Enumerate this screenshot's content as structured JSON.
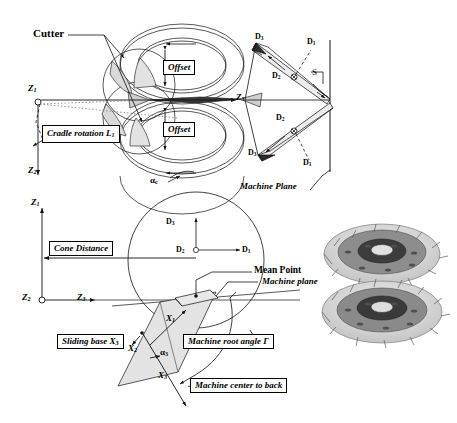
{
  "figure": {
    "type": "technical-diagram",
    "panels": [
      "top-cutter-cradle-view",
      "bottom-cone-distance-view",
      "gear-pair-photo"
    ]
  },
  "top_panel": {
    "callouts": {
      "cutter": "Cutter",
      "cradle_rotation": "Cradle rotation L",
      "cradle_rotation_sub": "1",
      "offset_upper": "Offset",
      "offset_lower": "Offset",
      "machine_plane": "Machine Plane"
    },
    "axes": [
      {
        "name": "Z",
        "sub": "1",
        "role": "vertical-origin"
      },
      {
        "name": "Z",
        "sub": "2",
        "role": "vertical-down"
      },
      {
        "name": "Z",
        "sub": "3",
        "role": "horizontal-right"
      }
    ],
    "angle_label": {
      "symbol": "α",
      "sub": "c"
    },
    "blade_labels": {
      "upper": [
        "D3",
        "D1",
        "D2"
      ],
      "lower": [
        "D2",
        "D3",
        "D1"
      ],
      "point_label": "S"
    },
    "d_names": {
      "d1": "D",
      "d1_sub": "1",
      "d2": "D",
      "d2_sub": "2",
      "d3": "D",
      "d3_sub": "3"
    }
  },
  "bottom_panel": {
    "callouts": {
      "cone_distance": "Cone Distance",
      "mean_point": "Mean Point",
      "machine_plane": "Machine plane",
      "sliding_base": "Sliding base X",
      "sliding_base_sub": "3",
      "machine_root_angle": "Machine root angle Γ",
      "machine_center_to_back": "Machine center to back"
    },
    "axes": [
      {
        "name": "Z",
        "sub": "1"
      },
      {
        "name": "Z",
        "sub": "2"
      },
      {
        "name": "Z",
        "sub": "3"
      },
      {
        "name": "X",
        "sub": "1"
      },
      {
        "name": "X",
        "sub": "2"
      },
      {
        "name": "X",
        "sub": "3"
      }
    ],
    "d_axes": {
      "d1": "D",
      "d1_sub": "1",
      "d2": "D",
      "d2_sub": "2",
      "d3": "D",
      "d3_sub": "3"
    },
    "angle_label": {
      "symbol": "α",
      "sub": "3"
    }
  },
  "photo": {
    "caption": "",
    "alt_name": "meshed-bevel-gear-pair-photograph"
  },
  "colors": {
    "line": "#111111",
    "shade": "#d9d9d9",
    "shade_light": "#e8e8e8",
    "background": "#ffffff"
  }
}
